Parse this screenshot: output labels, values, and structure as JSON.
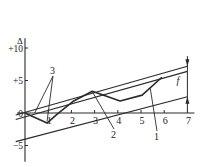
{
  "chart_data": {
    "type": "line",
    "title": "",
    "ylabel": "Δ",
    "xlabel": "",
    "x_ticks": [
      "1",
      "2",
      "3",
      "4",
      "5",
      "6",
      "7"
    ],
    "y_ticks": [
      {
        "value": 10,
        "label": "+10"
      },
      {
        "value": 5,
        "label": "+5"
      },
      {
        "value": 0,
        "label": "0"
      },
      {
        "value": -5,
        "label": "-5"
      }
    ],
    "xlim": [
      0,
      7.3
    ],
    "ylim": [
      -7.5,
      11.5
    ],
    "series": [
      {
        "name": "profile-curve",
        "label": "1",
        "points": [
          [
            0,
            0
          ],
          [
            0.95,
            -1.55
          ],
          [
            1.4,
            -0.15
          ],
          [
            2.1,
            1.85
          ],
          [
            2.9,
            3.35
          ],
          [
            4.1,
            1.85
          ],
          [
            5.05,
            2.75
          ],
          [
            5.9,
            5.5
          ]
        ]
      }
    ],
    "envelope_lines": [
      {
        "name": "upper-envelope-line-a",
        "label": "3",
        "from": [
          -0.4,
          -0.3
        ],
        "to": [
          7.0,
          7.2
        ]
      },
      {
        "name": "upper-envelope-line-b",
        "label": "3",
        "from": [
          -0.4,
          -1.0
        ],
        "to": [
          7.0,
          6.4
        ]
      },
      {
        "name": "lower-envelope-line",
        "label": "2",
        "from": [
          -0.4,
          -4.4
        ],
        "to": [
          7.0,
          2.5
        ]
      }
    ],
    "annotations": [
      {
        "name": "label-3",
        "text": "3",
        "leaders_to": [
          [
            -0.1,
            -0.6
          ],
          [
            0.95,
            -1.3
          ]
        ]
      },
      {
        "name": "label-2",
        "text": "2",
        "leader_to": [
          2.9,
          3.3
        ]
      },
      {
        "name": "label-1",
        "text": "1",
        "leader_to": [
          5.4,
          3.8
        ]
      },
      {
        "name": "dimension-f",
        "text": "f",
        "at_x": 7.0,
        "from": 7.2,
        "to": 2.5
      }
    ]
  }
}
